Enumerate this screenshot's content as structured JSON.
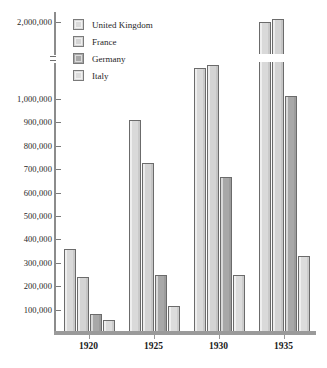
{
  "chart_data": {
    "type": "bar",
    "title": "",
    "subtitle": "",
    "xlabel": "",
    "ylabel": "",
    "categories": [
      "1920",
      "1925",
      "1930",
      "1935"
    ],
    "series": [
      {
        "name": "United Kingdom",
        "color": "#d9d9d9",
        "values": [
          360000,
          910000,
          1450000,
          2000000
        ]
      },
      {
        "name": "France",
        "color": "#d4d4d4",
        "values": [
          240000,
          725000,
          1490000,
          2080000
        ]
      },
      {
        "name": "Germany",
        "color": "#a8a8a8",
        "values": [
          80000,
          250000,
          665000,
          1040000
        ]
      },
      {
        "name": "Italy",
        "color": "#dcdcdc",
        "values": [
          55000,
          115000,
          250000,
          330000
        ]
      }
    ],
    "ytick_labels": [
      "100,000",
      "200,000",
      "300,000",
      "400,000",
      "500,000",
      "600,000",
      "700,000",
      "800,000",
      "900,000",
      "1,000,000",
      "2,000,000"
    ],
    "ytick_values": [
      100000,
      200000,
      300000,
      400000,
      500000,
      600000,
      700000,
      800000,
      900000,
      1000000,
      2000000
    ],
    "ylim": [
      0,
      2200000
    ],
    "axis_break": {
      "present": true,
      "from": 1000000,
      "to": 2000000
    },
    "grid": false,
    "legend_position": "top-left",
    "legend_entries": [
      "United Kingdom",
      "France",
      "Germany",
      "Italy"
    ]
  },
  "axis": {
    "break_icon": "axis-break-icon"
  }
}
